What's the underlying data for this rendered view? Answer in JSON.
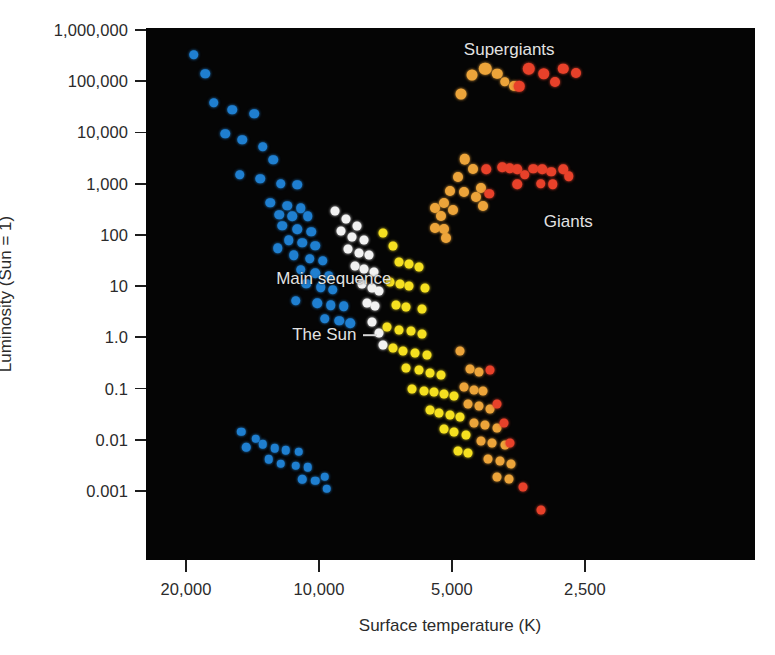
{
  "chart_data": {
    "type": "scatter",
    "title": "",
    "xlabel": "Surface temperature (K)",
    "ylabel": "Luminosity (Sun = 1)",
    "x_scale": "log-reversed",
    "y_scale": "log",
    "xticks": [
      "20,000",
      "10,000",
      "5,000",
      "2,500"
    ],
    "xtick_values": [
      20000,
      10000,
      5000,
      2500
    ],
    "yticks": [
      "1,000,000",
      "100,000",
      "10,000",
      "1,000",
      "100",
      "10",
      "1.0",
      "0.1",
      "0.01",
      "0.001"
    ],
    "ytick_values": [
      1000000,
      100000,
      10000,
      1000,
      100,
      10,
      1,
      0.1,
      0.01,
      0.001
    ],
    "xlim": [
      26000,
      2100
    ],
    "ylim": [
      0.0002,
      3000000
    ],
    "grid": false,
    "legend": "none",
    "background": "#050505",
    "colors": {
      "blue": "#1f7fd0",
      "white": "#f2f2f2",
      "yellow": "#f5e020",
      "orange": "#eca43a",
      "deep_orange": "#e8903a",
      "red": "#e8412a"
    },
    "annotations": [
      {
        "label": "Supergiants",
        "x": 4700,
        "y": 400000
      },
      {
        "label": "Giants",
        "x": 3100,
        "y": 180
      },
      {
        "label": "Main sequence",
        "x": 12500,
        "y": 14
      },
      {
        "label": "The Sun",
        "x": 11500,
        "y": 1.1,
        "leader_to_x": 7400
      }
    ],
    "series": [
      {
        "name": "Main sequence (O/B/A - blue)",
        "color": "#1f7fd0",
        "points": [
          [
            19200,
            330000,
            9.5
          ],
          [
            18100,
            140000,
            9.5
          ],
          [
            17300,
            38000,
            9.5
          ],
          [
            15700,
            28000,
            9.5
          ],
          [
            14000,
            23000,
            9.5
          ],
          [
            16300,
            9500,
            9.5
          ],
          [
            14900,
            7200,
            9.5
          ],
          [
            13400,
            5200,
            9.5
          ],
          [
            12700,
            2900,
            9.5
          ],
          [
            15100,
            1500,
            9.5
          ],
          [
            13600,
            1250,
            9.5
          ],
          [
            12200,
            1000,
            9.5
          ],
          [
            11200,
            950,
            9.5
          ],
          [
            12900,
            420,
            9.5
          ],
          [
            11800,
            370,
            9.5
          ],
          [
            11000,
            330,
            9.5
          ],
          [
            12300,
            250,
            9.5
          ],
          [
            11500,
            230,
            9.5
          ],
          [
            10600,
            230,
            9.5
          ],
          [
            12100,
            150,
            9.5
          ],
          [
            11200,
            130,
            9.5
          ],
          [
            10400,
            115,
            9.5
          ],
          [
            11700,
            78,
            9.5
          ],
          [
            10900,
            70,
            9.5
          ],
          [
            10200,
            62,
            9.5
          ],
          [
            12400,
            55,
            9.5
          ],
          [
            11400,
            40,
            9.5
          ],
          [
            10500,
            34,
            9.5
          ],
          [
            9800,
            31,
            9.5
          ],
          [
            11000,
            21,
            9.5
          ],
          [
            10200,
            18,
            9.5
          ],
          [
            9500,
            16,
            9.5
          ],
          [
            10700,
            11,
            9.5
          ],
          [
            9900,
            9.5,
            9.5
          ],
          [
            9300,
            8.5,
            9.5
          ],
          [
            11300,
            5.2,
            9.5
          ],
          [
            10100,
            4.6,
            9.5
          ],
          [
            9400,
            4.2,
            9.5
          ],
          [
            8800,
            4.0,
            9.5
          ],
          [
            9700,
            2.3,
            9.5
          ],
          [
            9000,
            2.1,
            9.5
          ],
          [
            8500,
            1.9,
            9.5
          ]
        ]
      },
      {
        "name": "Main sequence (F - white)",
        "color": "#f2f2f2",
        "points": [
          [
            9200,
            290,
            9
          ],
          [
            8700,
            205,
            9
          ],
          [
            8200,
            150,
            9
          ],
          [
            8900,
            120,
            9
          ],
          [
            8400,
            90,
            9
          ],
          [
            7900,
            78,
            9
          ],
          [
            8600,
            52,
            9
          ],
          [
            8100,
            45,
            9
          ],
          [
            7700,
            40,
            9
          ],
          [
            8300,
            25,
            9
          ],
          [
            7900,
            22,
            9
          ],
          [
            7500,
            19,
            9
          ],
          [
            8000,
            11,
            9
          ],
          [
            7600,
            9.0,
            9
          ],
          [
            7300,
            8.0,
            9
          ],
          [
            7800,
            4.6,
            9
          ],
          [
            7450,
            4.0,
            9
          ],
          [
            7600,
            2.0,
            9
          ],
          [
            7300,
            1.2,
            9
          ],
          [
            7150,
            0.72,
            9
          ]
        ]
      },
      {
        "name": "Main sequence (G/K - yellow)",
        "color": "#f5e020",
        "points": [
          [
            7150,
            110,
            9
          ],
          [
            6800,
            62,
            9
          ],
          [
            6600,
            30,
            9
          ],
          [
            6250,
            27,
            9
          ],
          [
            5950,
            24,
            9
          ],
          [
            6900,
            12,
            9
          ],
          [
            6550,
            11,
            9
          ],
          [
            6250,
            10,
            9
          ],
          [
            5750,
            9.2,
            9
          ],
          [
            6700,
            4.3,
            9
          ],
          [
            6350,
            3.9,
            9
          ],
          [
            5850,
            3.6,
            9
          ],
          [
            7000,
            1.6,
            9
          ],
          [
            6600,
            1.4,
            9
          ],
          [
            6200,
            1.3,
            9
          ],
          [
            5850,
            1.15,
            9
          ],
          [
            6800,
            0.62,
            9
          ],
          [
            6450,
            0.55,
            9
          ],
          [
            6050,
            0.5,
            9
          ],
          [
            5700,
            0.46,
            9
          ],
          [
            6350,
            0.25,
            9
          ],
          [
            5950,
            0.23,
            9
          ],
          [
            5600,
            0.2,
            9
          ],
          [
            5300,
            0.18,
            9
          ],
          [
            6150,
            0.1,
            9
          ],
          [
            5800,
            0.09,
            9
          ],
          [
            5500,
            0.085,
            9
          ],
          [
            5200,
            0.08,
            9
          ],
          [
            4950,
            0.072,
            9
          ],
          [
            5600,
            0.038,
            9
          ],
          [
            5350,
            0.034,
            9
          ],
          [
            5050,
            0.03,
            9
          ],
          [
            4800,
            0.028,
            9
          ],
          [
            5200,
            0.016,
            9
          ],
          [
            4950,
            0.014,
            9
          ],
          [
            4650,
            0.0125,
            9
          ],
          [
            4850,
            0.006,
            9
          ],
          [
            4600,
            0.0055,
            9
          ]
        ]
      },
      {
        "name": "Main sequence (K/M - orange)",
        "color": "#eca43a",
        "points": [
          [
            4800,
            0.55,
            9
          ],
          [
            4550,
            0.24,
            9
          ],
          [
            4350,
            0.21,
            9
          ],
          [
            4700,
            0.105,
            9
          ],
          [
            4450,
            0.095,
            9
          ],
          [
            4250,
            0.088,
            9
          ],
          [
            4600,
            0.05,
            9
          ],
          [
            4350,
            0.045,
            9
          ],
          [
            4100,
            0.04,
            9
          ],
          [
            4450,
            0.021,
            9
          ],
          [
            4200,
            0.019,
            9
          ],
          [
            3950,
            0.017,
            9
          ],
          [
            4300,
            0.0095,
            9
          ],
          [
            4050,
            0.0085,
            9
          ],
          [
            3800,
            0.0078,
            9
          ],
          [
            4150,
            0.0042,
            9
          ],
          [
            3900,
            0.0038,
            9
          ],
          [
            3680,
            0.0034,
            9
          ],
          [
            3950,
            0.0019,
            9
          ],
          [
            3720,
            0.0017,
            9
          ]
        ]
      },
      {
        "name": "Main sequence (M - red)",
        "color": "#e8412a",
        "points": [
          [
            4100,
            0.23,
            9
          ],
          [
            3950,
            0.05,
            9
          ],
          [
            3820,
            0.021,
            9
          ],
          [
            3700,
            0.0085,
            9
          ],
          [
            3450,
            0.0012,
            9
          ],
          [
            3150,
            0.00042,
            9
          ]
        ]
      },
      {
        "name": "White dwarfs",
        "color": "#1f7fd0",
        "points": [
          [
            15000,
            0.0145,
            8.5
          ],
          [
            13900,
            0.0105,
            8.5
          ],
          [
            14600,
            0.0072,
            8.5
          ],
          [
            13400,
            0.0082,
            8.5
          ],
          [
            12600,
            0.0068,
            8.5
          ],
          [
            13000,
            0.0042,
            8.5
          ],
          [
            11900,
            0.0062,
            8.5
          ],
          [
            11100,
            0.0058,
            8.5
          ],
          [
            12200,
            0.0034,
            8.5
          ],
          [
            11300,
            0.0031,
            8.5
          ],
          [
            10600,
            0.0029,
            8.5
          ],
          [
            10900,
            0.0017,
            8.5
          ],
          [
            10200,
            0.0016,
            8.5
          ],
          [
            9700,
            0.0019,
            8.5
          ],
          [
            9600,
            0.0011,
            8.5
          ]
        ]
      },
      {
        "name": "Supergiants",
        "color": "#eca43a",
        "points": [
          [
            4780,
            56000,
            11
          ],
          [
            4500,
            130000,
            11
          ],
          [
            4200,
            175000,
            12.5
          ],
          [
            3950,
            140000,
            10.5
          ],
          [
            3800,
            98000,
            9.5
          ],
          [
            3620,
            82000,
            10
          ]
        ]
      },
      {
        "name": "Supergiants (red)",
        "color": "#e8412a",
        "points": [
          [
            3520,
            80000,
            10.5
          ],
          [
            3350,
            175000,
            12.5
          ],
          [
            3100,
            140000,
            11.5
          ],
          [
            2920,
            95000,
            10
          ],
          [
            2800,
            175000,
            10.5
          ],
          [
            2620,
            145000,
            10
          ]
        ]
      },
      {
        "name": "Giants (orange)",
        "color": "#eca43a",
        "points": [
          [
            4850,
            1350,
            10
          ],
          [
            4680,
            3000,
            10.5
          ],
          [
            4700,
            700,
            10
          ],
          [
            4480,
            1900,
            10
          ],
          [
            4420,
            540,
            10
          ],
          [
            5050,
            720,
            10
          ],
          [
            4980,
            300,
            10
          ],
          [
            5200,
            420,
            10
          ],
          [
            5450,
            330,
            10
          ],
          [
            5300,
            230,
            10
          ],
          [
            5450,
            135,
            10
          ],
          [
            5200,
            130,
            10
          ],
          [
            5150,
            88,
            10
          ],
          [
            4300,
            820,
            10
          ],
          [
            4250,
            360,
            10
          ]
        ]
      },
      {
        "name": "Giants (red)",
        "color": "#e8412a",
        "points": [
          [
            4180,
            1900,
            9.5
          ],
          [
            4120,
            640,
            9.5
          ],
          [
            3850,
            2100,
            9.5
          ],
          [
            3700,
            2000,
            9.5
          ],
          [
            3560,
            1900,
            9.5
          ],
          [
            3560,
            980,
            9.5
          ],
          [
            3420,
            1500,
            9.5
          ],
          [
            3270,
            1950,
            9.5
          ],
          [
            3120,
            1900,
            9.5
          ],
          [
            3150,
            1000,
            9.5
          ],
          [
            2980,
            1700,
            9.5
          ],
          [
            2960,
            980,
            9.5
          ],
          [
            2800,
            1900,
            9.5
          ],
          [
            2720,
            1400,
            9.5
          ]
        ]
      }
    ]
  }
}
